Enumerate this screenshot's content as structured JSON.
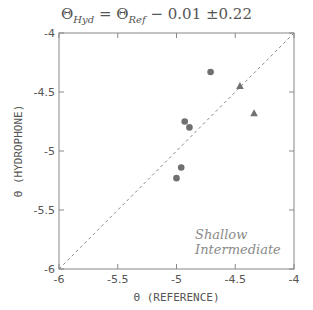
{
  "chart_data": {
    "type": "scatter",
    "title": "ΘHyd = ΘRef − 0.01 ±0.22",
    "title_parts": {
      "theta": "Θ",
      "sub_hyd": "Hyd",
      "eq": " = ",
      "sub_ref": "Ref",
      "rest": " − 0.01 ±0.22"
    },
    "xlabel": "Θ (REFERENCE)",
    "ylabel": "Θ (HYDROPHONE)",
    "xlim": [
      -6,
      -4
    ],
    "ylim": [
      -6,
      -4
    ],
    "xticks": [
      "-6",
      "-5.5",
      "-5",
      "-4.5",
      "-4"
    ],
    "yticks": [
      "-6",
      "-5.5",
      "-5",
      "-4.5",
      "-4"
    ],
    "grid": false,
    "reference_line": {
      "style": "dashed",
      "from": [
        -6,
        -6
      ],
      "to": [
        -4,
        -4
      ]
    },
    "series": [
      {
        "name": "Shallow",
        "marker": "circle",
        "color": "#707070",
        "points": [
          [
            -4.71,
            -4.33
          ],
          [
            -4.93,
            -4.75
          ],
          [
            -4.89,
            -4.8
          ],
          [
            -4.96,
            -5.14
          ],
          [
            -5.0,
            -5.23
          ]
        ]
      },
      {
        "name": "Intermediate",
        "marker": "triangle",
        "color": "#707070",
        "points": [
          [
            -4.46,
            -4.45
          ],
          [
            -4.34,
            -4.68
          ]
        ]
      }
    ],
    "legend": {
      "position": "lower right",
      "entries": [
        "Shallow",
        "Intermediate"
      ]
    }
  }
}
